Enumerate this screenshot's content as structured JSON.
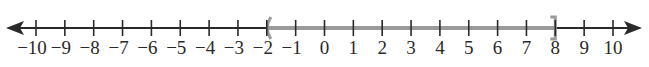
{
  "diagram": {
    "type": "number-line",
    "min": -10,
    "max": 10,
    "step": 1,
    "tick_labels": [
      "−10",
      "−9",
      "−8",
      "−7",
      "−6",
      "−5",
      "−4",
      "−3",
      "−2",
      "−1",
      "0",
      "1",
      "2",
      "3",
      "4",
      "5",
      "6",
      "7",
      "8",
      "9",
      "10"
    ],
    "interval": {
      "start": -2,
      "end": 8,
      "start_bracket": "(",
      "end_bracket": "]",
      "notation": "(-2, 8]"
    },
    "arrows": [
      "left",
      "right"
    ],
    "colors": {
      "axis": "#2a2a2a",
      "interval": "#9a9a9a",
      "label": "#2a2a2a"
    }
  }
}
